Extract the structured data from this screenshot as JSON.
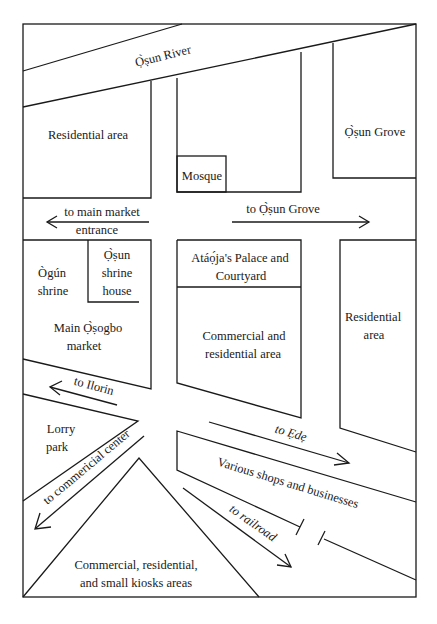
{
  "map": {
    "border_color": "#1a1a1a",
    "background": "#ffffff",
    "labels": {
      "osun_river": "Ọ̀ṣun River",
      "residential_area_nw": "Residential area",
      "mosque": "Mosque",
      "osun_grove": "Ọ̀ṣun Grove",
      "main_market_arrow_line1": "to main market",
      "main_market_arrow_line2": "entrance",
      "osun_grove_arrow": "to Ọ̀ṣun Grove",
      "ogun_shrine_line1": "Ògún",
      "ogun_shrine_line2": "shrine",
      "osun_shrine_house_line1": "Ọ̀ṣun",
      "osun_shrine_house_line2": "shrine",
      "osun_shrine_house_line3": "house",
      "main_market_line1": "Main Ọ̀ṣogbo",
      "main_market_line2": "market",
      "palace_line1": "Atáọ́ja's Palace and",
      "palace_line2": "Courtyard",
      "commercial_residential_line1": "Commercial and",
      "commercial_residential_line2": "residential area",
      "residential_area_e_line1": "Residential",
      "residential_area_e_line2": "area",
      "ilorin_arrow": "to Ilorin",
      "lorry_park_line1": "Lorry",
      "lorry_park_line2": "park",
      "commercial_center_arrow": "to commericial center",
      "ede_arrow": "to Ẹdẹ",
      "shops": "Various shops and businesses",
      "railroad_arrow": "to railroad",
      "kiosks_line1": "Commercial, residential,",
      "kiosks_line2": "and small kiosks areas"
    }
  }
}
